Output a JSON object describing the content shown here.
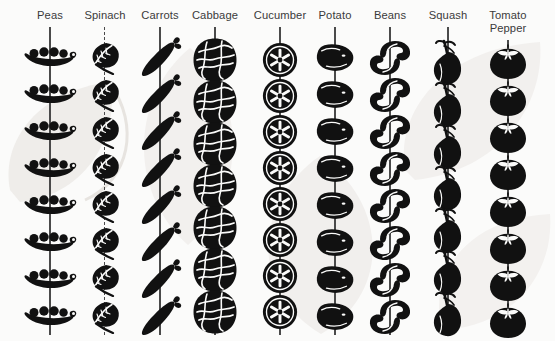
{
  "figure": {
    "background_color": "#fbfbfa",
    "icon_color": "#111111",
    "stem_color": "#4a4a4a",
    "label_color": "#3a3a3a",
    "watermark_color": "#eceae7"
  },
  "chart_data": {
    "type": "pictogram",
    "title": "",
    "subtitle": "",
    "xlabel": "",
    "ylabel": "",
    "legend_position": "none",
    "grid": false,
    "orientation": "vertical-strings",
    "categories": [
      "Peas",
      "Spinach",
      "Carrots",
      "Cabbage",
      "Cucumber",
      "Potato",
      "Beans",
      "Squash",
      "Tomato Pepper"
    ],
    "values": [
      8,
      8,
      8,
      7,
      8,
      8,
      8,
      7,
      8
    ],
    "series": [
      {
        "name": "Icon count per column",
        "values": [
          8,
          8,
          8,
          7,
          8,
          8,
          8,
          7,
          8
        ]
      }
    ]
  },
  "columns": [
    {
      "id": "peas",
      "label": "Peas",
      "label_line2": "",
      "icon_name": "pea-pod-icon",
      "count": 8,
      "center_x": 50,
      "icon_width": 56,
      "icon_height": 30,
      "first_y": 58,
      "spacing": 37,
      "stem_style": "solid"
    },
    {
      "id": "spinach",
      "label": "Spinach",
      "label_line2": "",
      "icon_name": "spinach-leaf-icon",
      "count": 8,
      "center_x": 105,
      "icon_width": 42,
      "icon_height": 34,
      "first_y": 58,
      "spacing": 37,
      "stem_style": "dashed"
    },
    {
      "id": "carrots",
      "label": "Carrots",
      "label_line2": "",
      "icon_name": "carrot-icon",
      "count": 8,
      "center_x": 160,
      "icon_width": 46,
      "icon_height": 46,
      "first_y": 58,
      "spacing": 37,
      "stem_style": "solid"
    },
    {
      "id": "cabbage",
      "label": "Cabbage",
      "label_line2": "",
      "icon_name": "cabbage-head-icon",
      "count": 7,
      "center_x": 215,
      "icon_width": 46,
      "icon_height": 46,
      "first_y": 60,
      "spacing": 42,
      "stem_style": "solid"
    },
    {
      "id": "cucumber",
      "label": "Cucumber",
      "label_line2": "",
      "icon_name": "cucumber-slice-icon",
      "count": 8,
      "center_x": 280,
      "icon_width": 36,
      "icon_height": 36,
      "first_y": 60,
      "spacing": 36,
      "stem_style": "solid"
    },
    {
      "id": "potato",
      "label": "Potato",
      "label_line2": "",
      "icon_name": "potato-tuber-icon",
      "count": 8,
      "center_x": 335,
      "icon_width": 40,
      "icon_height": 32,
      "first_y": 58,
      "spacing": 37,
      "stem_style": "solid"
    },
    {
      "id": "beans",
      "label": "Beans",
      "label_line2": "",
      "icon_name": "bean-pod-icon",
      "count": 8,
      "center_x": 390,
      "icon_width": 46,
      "icon_height": 38,
      "first_y": 58,
      "spacing": 37,
      "stem_style": "solid"
    },
    {
      "id": "squash",
      "label": "Squash",
      "label_line2": "",
      "icon_name": "squash-icon",
      "count": 7,
      "center_x": 448,
      "icon_width": 40,
      "icon_height": 48,
      "first_y": 62,
      "spacing": 42,
      "stem_style": "solid"
    },
    {
      "id": "tomato-pepper",
      "label": "Tomato",
      "label_line2": "Pepper",
      "icon_name": "tomato-icon",
      "count": 8,
      "center_x": 508,
      "icon_width": 40,
      "icon_height": 36,
      "first_y": 62,
      "spacing": 37,
      "stem_style": "solid"
    }
  ]
}
